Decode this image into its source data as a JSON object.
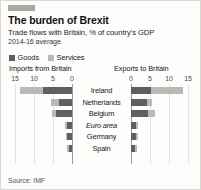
{
  "card": {
    "accent_color": "#a9aaa6",
    "title": "The burden of Brexit",
    "subtitle": "Trade flows with Britain, % of country's GDP",
    "period": "2014-16 average",
    "source": "Source: IMF"
  },
  "legend": {
    "items": [
      {
        "label": "Goods",
        "color": "#5e5f63"
      },
      {
        "label": "Services",
        "color": "#b9bab6"
      }
    ]
  },
  "panels": {
    "left_title": "Imports from Britain",
    "right_title": "Exports to Britain"
  },
  "chart_data": {
    "type": "bar",
    "title": "The burden of Brexit",
    "subtitle": "Trade flows with Britain, % of country's GDP",
    "note": "2014-16 average",
    "orientation": "horizontal-diverging",
    "categories": [
      "Ireland",
      "Netherlands",
      "Belgium",
      "Euro area",
      "Germany",
      "Spain"
    ],
    "italic_categories": [
      "Euro area"
    ],
    "panels": [
      {
        "name": "Imports from Britain",
        "xlabel": "Imports from Britain",
        "direction": "left",
        "ticks": [
          15,
          10,
          5,
          0
        ],
        "xlim": [
          0,
          15
        ],
        "series": [
          {
            "name": "Goods",
            "color": "#5e5f63",
            "values": [
              7.6,
              3.5,
              4.2,
              1.3,
              1.2,
              0.9
            ]
          },
          {
            "name": "Services",
            "color": "#b9bab6",
            "values": [
              6.2,
              1.9,
              1.0,
              0.5,
              0.5,
              0.4
            ]
          }
        ],
        "totals": [
          13.8,
          5.4,
          5.2,
          1.8,
          1.7,
          1.3
        ]
      },
      {
        "name": "Exports to Britain",
        "xlabel": "Exports to Britain",
        "direction": "right",
        "ticks": [
          0,
          5,
          10,
          15
        ],
        "xlim": [
          0,
          15
        ],
        "series": [
          {
            "name": "Goods",
            "color": "#5e5f63",
            "values": [
              5.2,
              4.3,
              4.6,
              1.4,
              1.4,
              1.1
            ]
          },
          {
            "name": "Services",
            "color": "#b9bab6",
            "values": [
              8.4,
              1.2,
              1.6,
              0.5,
              0.4,
              0.5
            ]
          }
        ],
        "totals": [
          13.6,
          5.5,
          6.2,
          1.9,
          1.8,
          1.6
        ]
      }
    ],
    "grid": true,
    "legend_position": "top-left",
    "source": "Source: IMF"
  }
}
